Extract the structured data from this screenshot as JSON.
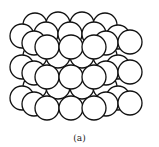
{
  "figure": {
    "caption": "(a)",
    "colors": {
      "fill": "#ffffff",
      "stroke": "#111111"
    },
    "radius": 12,
    "layers": [
      {
        "name": "back-layer",
        "spheres": [
          [
            35,
            25
          ],
          [
            58,
            24
          ],
          [
            82,
            24
          ],
          [
            105,
            25
          ],
          [
            35,
            56
          ],
          [
            58,
            56
          ],
          [
            82,
            56
          ],
          [
            105,
            56
          ],
          [
            35,
            87
          ],
          [
            58,
            87
          ],
          [
            82,
            87
          ],
          [
            105,
            87
          ]
        ]
      },
      {
        "name": "middle-layer",
        "spheres": [
          [
            22,
            36
          ],
          [
            46,
            34
          ],
          [
            70,
            34
          ],
          [
            94,
            34
          ],
          [
            118,
            37
          ],
          [
            22,
            67
          ],
          [
            118,
            67
          ],
          [
            22,
            98
          ],
          [
            118,
            98
          ],
          [
            34,
            43
          ],
          [
            106,
            43
          ],
          [
            130,
            42
          ],
          [
            34,
            73
          ],
          [
            106,
            73
          ],
          [
            130,
            72
          ],
          [
            34,
            104
          ],
          [
            106,
            104
          ],
          [
            130,
            103
          ]
        ]
      },
      {
        "name": "front-layer",
        "spheres": [
          [
            47,
            47
          ],
          [
            71,
            47
          ],
          [
            94,
            47
          ],
          [
            47,
            77
          ],
          [
            71,
            77
          ],
          [
            94,
            77
          ],
          [
            47,
            108
          ],
          [
            71,
            108
          ],
          [
            94,
            108
          ]
        ]
      }
    ]
  }
}
